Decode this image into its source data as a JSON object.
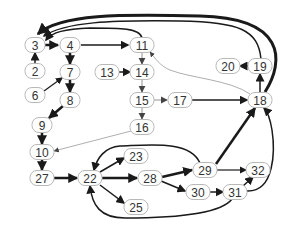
{
  "diagram": {
    "type": "directed-graph",
    "background": "#ffffff",
    "node_stroke": "#b8b8b8",
    "edge_color": "#1a1a1a",
    "nodes": [
      {
        "id": "3",
        "label": "3",
        "x": 35,
        "y": 45
      },
      {
        "id": "4",
        "label": "4",
        "x": 70,
        "y": 45
      },
      {
        "id": "11",
        "label": "11",
        "x": 142,
        "y": 45
      },
      {
        "id": "2",
        "label": "2",
        "x": 35,
        "y": 71
      },
      {
        "id": "7",
        "label": "7",
        "x": 70,
        "y": 72
      },
      {
        "id": "13",
        "label": "13",
        "x": 107,
        "y": 72
      },
      {
        "id": "14",
        "label": "14",
        "x": 142,
        "y": 72
      },
      {
        "id": "6",
        "label": "6",
        "x": 35,
        "y": 95
      },
      {
        "id": "8",
        "label": "8",
        "x": 70,
        "y": 100
      },
      {
        "id": "15",
        "label": "15",
        "x": 142,
        "y": 100
      },
      {
        "id": "17",
        "label": "17",
        "x": 180,
        "y": 100
      },
      {
        "id": "18",
        "label": "18",
        "x": 260,
        "y": 100
      },
      {
        "id": "20",
        "label": "20",
        "x": 228,
        "y": 66
      },
      {
        "id": "19",
        "label": "19",
        "x": 260,
        "y": 66
      },
      {
        "id": "9",
        "label": "9",
        "x": 42,
        "y": 125
      },
      {
        "id": "16",
        "label": "16",
        "x": 142,
        "y": 127
      },
      {
        "id": "10",
        "label": "10",
        "x": 42,
        "y": 152
      },
      {
        "id": "27",
        "label": "27",
        "x": 42,
        "y": 178
      },
      {
        "id": "22",
        "label": "22",
        "x": 90,
        "y": 178
      },
      {
        "id": "23",
        "label": "23",
        "x": 136,
        "y": 156
      },
      {
        "id": "28",
        "label": "28",
        "x": 150,
        "y": 178
      },
      {
        "id": "25",
        "label": "25",
        "x": 136,
        "y": 207
      },
      {
        "id": "29",
        "label": "29",
        "x": 205,
        "y": 170
      },
      {
        "id": "30",
        "label": "30",
        "x": 198,
        "y": 192
      },
      {
        "id": "31",
        "label": "31",
        "x": 235,
        "y": 192
      },
      {
        "id": "32",
        "label": "32",
        "x": 258,
        "y": 170
      }
    ],
    "edges": [
      {
        "from": "2",
        "to": "3",
        "weight": 1.5
      },
      {
        "from": "3",
        "to": "4",
        "weight": 2.5
      },
      {
        "from": "4",
        "to": "11",
        "weight": 1.5
      },
      {
        "from": "4",
        "to": "7",
        "weight": 2.5
      },
      {
        "from": "6",
        "to": "7",
        "weight": 1.2
      },
      {
        "from": "7",
        "to": "8",
        "weight": 2.5
      },
      {
        "from": "8",
        "to": "9",
        "weight": 2.5
      },
      {
        "from": "9",
        "to": "10",
        "weight": 2.5
      },
      {
        "from": "10",
        "to": "27",
        "weight": 2.5
      },
      {
        "from": "27",
        "to": "22",
        "weight": 2.5
      },
      {
        "from": "22",
        "to": "23",
        "weight": 1.5
      },
      {
        "from": "22",
        "to": "28",
        "weight": 2.5
      },
      {
        "from": "22",
        "to": "25",
        "weight": 1.5
      },
      {
        "from": "28",
        "to": "29",
        "weight": 2.5
      },
      {
        "from": "28",
        "to": "30",
        "weight": 1.5
      },
      {
        "from": "29",
        "to": "18",
        "weight": 2.5
      },
      {
        "from": "29",
        "to": "32",
        "weight": 1.2
      },
      {
        "from": "29",
        "to": "22",
        "weight": 1.5,
        "curved": true
      },
      {
        "from": "30",
        "to": "31",
        "weight": 1.5
      },
      {
        "from": "31",
        "to": "32",
        "weight": 1.5
      },
      {
        "from": "31",
        "to": "18",
        "weight": 1.5,
        "curved": true
      },
      {
        "from": "31",
        "to": "22",
        "weight": 1.5,
        "curved": true
      },
      {
        "from": "11",
        "to": "14",
        "weight": 0.8
      },
      {
        "from": "13",
        "to": "14",
        "weight": 1.5
      },
      {
        "from": "14",
        "to": "15",
        "weight": 0.8
      },
      {
        "from": "15",
        "to": "16",
        "weight": 0.8
      },
      {
        "from": "15",
        "to": "17",
        "weight": 0.8
      },
      {
        "from": "16",
        "to": "10",
        "weight": 0.6
      },
      {
        "from": "17",
        "to": "18",
        "weight": 1.5
      },
      {
        "from": "18",
        "to": "19",
        "weight": 1.5
      },
      {
        "from": "18",
        "to": "11",
        "weight": 0.6,
        "curved": true
      },
      {
        "from": "19",
        "to": "20",
        "weight": 1.5
      },
      {
        "from": "19",
        "to": "3",
        "weight": 1.5,
        "curved": true
      },
      {
        "from": "18",
        "to": "3",
        "weight": 3,
        "curved": true
      },
      {
        "from": "11",
        "to": "3",
        "weight": 1.5,
        "curved": true
      }
    ]
  }
}
